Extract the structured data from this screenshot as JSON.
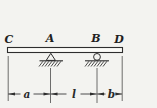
{
  "figure": {
    "kind": "simply-supported beam diagram with overhangs",
    "point_labels": {
      "left_end": "C",
      "pin_support": "A",
      "roller_support": "B",
      "right_end": "D"
    },
    "dimension_labels": {
      "left_overhang": "a",
      "span": "l",
      "right_overhang": "b"
    },
    "colors": {
      "background": "#f3f3f0",
      "line": "#2e2e2e",
      "thin_line": "#4a4a4a",
      "beam_fill": "#fbfbf8",
      "text": "#1f1f1f"
    }
  }
}
